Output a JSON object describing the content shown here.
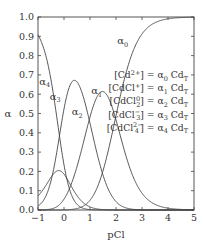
{
  "chart_data": {
    "type": "line",
    "title": "",
    "xlabel": "pCl",
    "ylabel": "α",
    "xlim": [
      -1,
      5
    ],
    "ylim": [
      0.0,
      1.0
    ],
    "xticks": [
      "-1",
      "0",
      "1",
      "2",
      "3",
      "4",
      "5"
    ],
    "yticks": [
      "0.0",
      "0.1",
      "0.2",
      "0.3",
      "0.4",
      "0.5",
      "0.6",
      "0.7",
      "0.8",
      "0.9",
      "1.0"
    ],
    "grid": false,
    "log_beta": [
      0,
      1.98,
      2.95,
      2.5,
      2.6
    ],
    "series": [
      {
        "name": "α0",
        "label": "α",
        "sub": "0",
        "label_pos": [
          2.05,
          0.86
        ]
      },
      {
        "name": "α1",
        "label": "α",
        "sub": "1",
        "label_pos": [
          1.05,
          0.6
        ]
      },
      {
        "name": "α2",
        "label": "α",
        "sub": "2",
        "label_pos": [
          0.3,
          0.49
        ]
      },
      {
        "name": "α3",
        "label": "α",
        "sub": "3",
        "label_pos": [
          -0.55,
          0.57
        ]
      },
      {
        "name": "α4",
        "label": "α",
        "sub": "4",
        "label_pos": [
          -0.95,
          0.65
        ]
      }
    ],
    "legend": [
      {
        "lhs": "[Cd",
        "sup": "2+",
        "rhs_pre": "] = α",
        "sub": "0",
        "rhs": " Cd",
        "tsub": "T"
      },
      {
        "lhs": "[CdCl",
        "sup": "+",
        "rhs_pre": "] = α",
        "sub": "1",
        "rhs": " Cd",
        "tsub": "T"
      },
      {
        "lhs": "[CdCl",
        "sup": "0",
        "lsub": "2",
        "rhs_pre": "] = α",
        "sub": "2",
        "rhs": " Cd",
        "tsub": "T"
      },
      {
        "lhs": "[CdCl",
        "sup": "−",
        "lsub": "3",
        "rhs_pre": "] = α",
        "sub": "3",
        "rhs": " Cd",
        "tsub": "T"
      },
      {
        "lhs": "[CdCl",
        "sup": "2−",
        "lsub": "4",
        "rhs_pre": "] = α",
        "sub": "4",
        "rhs": " Cd",
        "tsub": "T"
      }
    ]
  }
}
